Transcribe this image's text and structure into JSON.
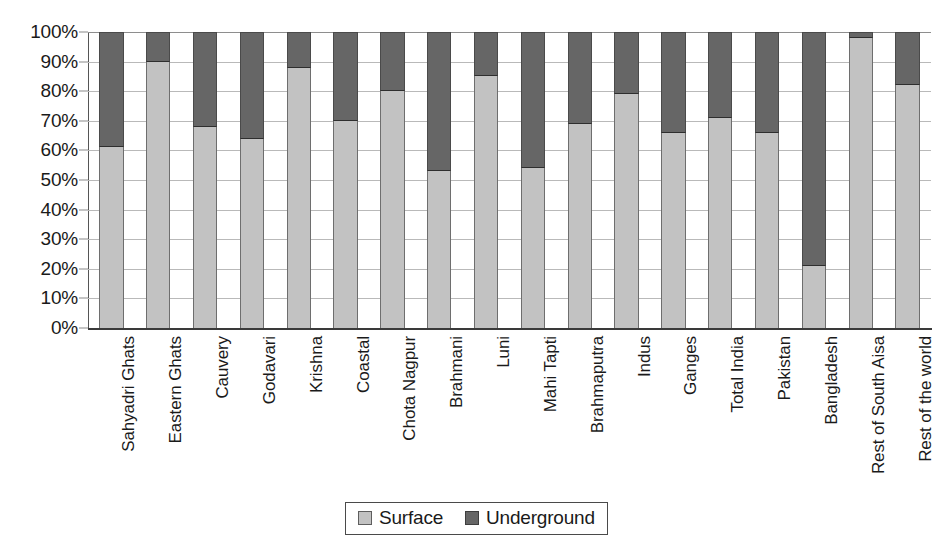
{
  "chart_data": {
    "type": "bar",
    "subtype": "stacked-percentage",
    "title": "",
    "subtitle": "",
    "xlabel": "",
    "ylabel": "",
    "ylim": [
      0,
      100
    ],
    "grid": true,
    "legend_position": "bottom",
    "categories": [
      "Sahyadri Ghats",
      "Eastern Ghats",
      "Cauvery",
      "Godavari",
      "Krishna",
      "Coastal",
      "Chota Nagpur",
      "Brahmani",
      "Luni",
      "Mahi Tapti",
      "Brahmaputra",
      "Indus",
      "Ganges",
      "Total India",
      "Pakistan",
      "Bangladesh",
      "Rest of South Aisa",
      "Rest of the world"
    ],
    "series": [
      {
        "name": "Surface",
        "color": "#c2c2c2",
        "values": [
          61,
          90,
          68,
          64,
          88,
          70,
          80,
          53,
          85,
          54,
          69,
          79,
          66,
          71,
          66,
          21,
          98,
          82
        ]
      },
      {
        "name": "Underground",
        "color": "#666666",
        "values": [
          39,
          10,
          32,
          36,
          12,
          30,
          20,
          47,
          15,
          46,
          31,
          21,
          34,
          29,
          34,
          79,
          2,
          18
        ]
      }
    ],
    "y_ticks": [
      "0%",
      "10%",
      "20%",
      "30%",
      "40%",
      "50%",
      "60%",
      "70%",
      "80%",
      "90%",
      "100%"
    ],
    "y_tick_values": [
      0,
      10,
      20,
      30,
      40,
      50,
      60,
      70,
      80,
      90,
      100
    ]
  },
  "legend": {
    "items": [
      {
        "label": "Surface",
        "color": "#c2c2c2"
      },
      {
        "label": "Underground",
        "color": "#666666"
      }
    ]
  },
  "colors": {
    "surface": "#c2c2c2",
    "underground": "#666666",
    "gridline": "#b9b9b9",
    "axis": "#3a3a3a",
    "text": "#1a1a1a",
    "background": "#ffffff"
  }
}
